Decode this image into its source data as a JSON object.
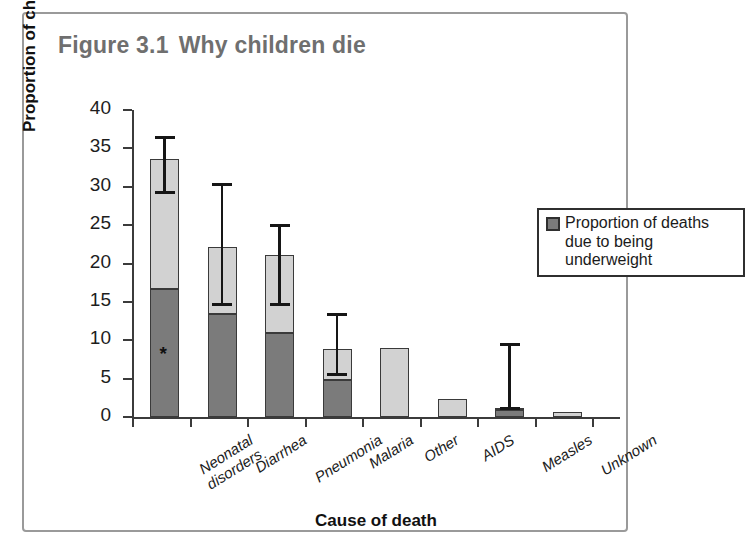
{
  "figure": {
    "number": "Figure 3.1",
    "title": "Why children die"
  },
  "legend": {
    "label": "Proportion of deaths due to being underweight",
    "swatch_color": "#7b7b7b",
    "position": "top-right inside plot"
  },
  "colors": {
    "bar_light": "#d2d2d2",
    "bar_dark": "#7b7b7b",
    "bar_outline": "#3a3a3a",
    "axis": "#3b3b3b",
    "title_text": "#6f6f6f",
    "frame": "#9a9a9a",
    "error_bar": "#161616"
  },
  "annotations": {
    "star_symbol": "*",
    "star_category": "Neonatal disorders"
  },
  "chart_data": {
    "type": "bar",
    "xlabel": "Cause of death",
    "ylabel": "Proportion of child deaths (%)",
    "ylim": [
      0,
      40
    ],
    "yticks": [
      0,
      5,
      10,
      15,
      20,
      25,
      30,
      35,
      40
    ],
    "ytick_labels": [
      "0",
      "5",
      "10",
      "15",
      "20",
      "25",
      "30",
      "35",
      "40"
    ],
    "grid": false,
    "stacked": true,
    "legend_position": "upper right",
    "categories": [
      "Neonatal\ndisorders",
      "Diarrhea",
      "Pneumonia",
      "Malaria",
      "Other",
      "AIDS",
      "Measles",
      "Unknown"
    ],
    "series": [
      {
        "name": "Proportion of deaths due to being underweight",
        "color": "#7b7b7b",
        "values": [
          16.7,
          13.4,
          11.0,
          4.8,
          0.0,
          0.0,
          0.9,
          0.0
        ]
      },
      {
        "name": "Remaining proportion of child deaths",
        "color": "#d2d2d2",
        "values": [
          16.9,
          8.8,
          10.1,
          4.0,
          9.0,
          2.3,
          0.2,
          0.7
        ]
      }
    ],
    "totals": [
      33.6,
      22.2,
      21.1,
      8.8,
      9.0,
      2.3,
      1.1,
      0.7
    ],
    "error_bars": [
      {
        "category": "Neonatal disorders",
        "low": 29.3,
        "high": 36.4
      },
      {
        "category": "Diarrhea",
        "low": 14.7,
        "high": 30.3
      },
      {
        "category": "Pneumonia",
        "low": 14.7,
        "high": 24.9
      },
      {
        "category": "Malaria",
        "low": 5.6,
        "high": 13.3
      },
      {
        "category": "Other",
        "low": null,
        "high": null
      },
      {
        "category": "AIDS",
        "low": null,
        "high": null
      },
      {
        "category": "Measles",
        "low": 1.1,
        "high": 9.4
      },
      {
        "category": "Unknown",
        "low": null,
        "high": null
      }
    ]
  }
}
